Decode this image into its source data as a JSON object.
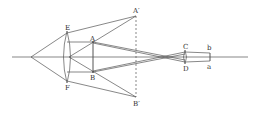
{
  "diagram": {
    "type": "optics-ray-diagram",
    "colors": {
      "line": "#555555",
      "label": "#333333",
      "background": "#ffffff"
    },
    "labels": {
      "A_prime": "A′",
      "B_prime": "B′",
      "E": "E",
      "F": "F",
      "A": "A",
      "B": "B",
      "C": "C",
      "D": "D",
      "b": "b",
      "a": "a"
    }
  }
}
